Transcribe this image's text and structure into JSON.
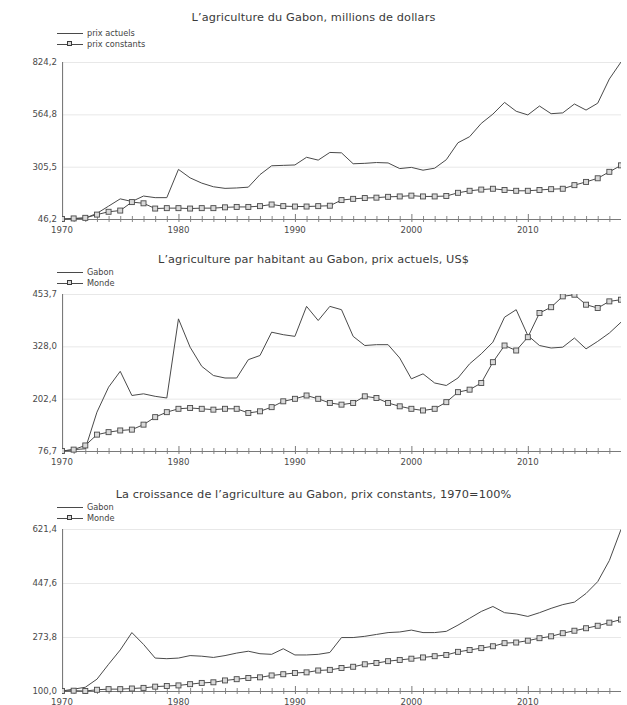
{
  "page": {
    "background": "#ffffff",
    "line_color": "#4a4a4a",
    "grid_color": "#e8e8e8",
    "axis_color": "#7a7a7a",
    "marker_fill": "#d9d9d9",
    "text_color": "#3b3b3b"
  },
  "charts": [
    {
      "id": "agriculture-gabon-millions-dollars",
      "type": "line",
      "title": "L’agriculture du Gabon, millions de dollars",
      "xlabel": "",
      "ylabel": "",
      "grid": true,
      "legend_position": "top-left",
      "x": [
        1970,
        1971,
        1972,
        1973,
        1974,
        1975,
        1976,
        1977,
        1978,
        1979,
        1980,
        1981,
        1982,
        1983,
        1984,
        1985,
        1986,
        1987,
        1988,
        1989,
        1990,
        1991,
        1992,
        1993,
        1994,
        1995,
        1996,
        1997,
        1998,
        1999,
        2000,
        2001,
        2002,
        2003,
        2004,
        2005,
        2006,
        2007,
        2008,
        2009,
        2010,
        2011,
        2012,
        2013,
        2014,
        2015,
        2016,
        2017,
        2018
      ],
      "xticks": [
        1970,
        1980,
        1990,
        2000,
        2010
      ],
      "yticks": [
        46.2,
        305.5,
        564.8,
        824.2
      ],
      "ylim": [
        46.2,
        824.2
      ],
      "xlim": [
        1970,
        2018
      ],
      "series": [
        {
          "name": "prix actuels",
          "marker": "none",
          "values": [
            46.2,
            48.0,
            50.5,
            74.0,
            110.0,
            146.0,
            133.0,
            160.0,
            152.0,
            152.0,
            292.0,
            250.0,
            224.0,
            206.0,
            198.0,
            200.0,
            204.0,
            266.0,
            310.0,
            312.0,
            314.0,
            352.0,
            338.0,
            376.0,
            374.0,
            320.0,
            322.0,
            326.0,
            324.0,
            296.0,
            302.0,
            288.0,
            298.0,
            340.0,
            424.0,
            454.0,
            520.0,
            566.0,
            624.0,
            580.0,
            562.0,
            606.0,
            568.0,
            572.0,
            616.0,
            586.0,
            620.0,
            740.0,
            824.2
          ]
        },
        {
          "name": "prix constants",
          "marker": "square",
          "values": [
            46.2,
            49.0,
            52.0,
            68.0,
            82.0,
            88.0,
            130.0,
            124.0,
            98.0,
            100.0,
            100.0,
            98.0,
            100.0,
            100.0,
            104.0,
            106.0,
            106.0,
            110.0,
            118.0,
            110.0,
            108.0,
            108.0,
            110.0,
            112.0,
            140.0,
            146.0,
            150.0,
            152.0,
            156.0,
            158.0,
            162.0,
            158.0,
            158.0,
            160.0,
            176.0,
            186.0,
            192.0,
            196.0,
            190.0,
            186.0,
            186.0,
            190.0,
            194.0,
            196.0,
            214.0,
            230.0,
            248.0,
            280.0,
            312.0
          ]
        }
      ]
    },
    {
      "id": "agriculture-par-habitant-gabon",
      "type": "line",
      "title": "L’agriculture par habitant au Gabon, prix actuels, US$",
      "xlabel": "",
      "ylabel": "",
      "grid": true,
      "legend_position": "top-left",
      "x": [
        1970,
        1971,
        1972,
        1973,
        1974,
        1975,
        1976,
        1977,
        1978,
        1979,
        1980,
        1981,
        1982,
        1983,
        1984,
        1985,
        1986,
        1987,
        1988,
        1989,
        1990,
        1991,
        1992,
        1993,
        1994,
        1995,
        1996,
        1997,
        1998,
        1999,
        2000,
        2001,
        2002,
        2003,
        2004,
        2005,
        2006,
        2007,
        2008,
        2009,
        2010,
        2011,
        2012,
        2013,
        2014,
        2015,
        2016,
        2017,
        2018
      ],
      "xticks": [
        1970,
        1980,
        1990,
        2000,
        2010
      ],
      "yticks": [
        76.7,
        202.4,
        328.0,
        453.7
      ],
      "ylim": [
        76.7,
        453.7
      ],
      "xlim": [
        1970,
        2018
      ],
      "series": [
        {
          "name": "Gabon",
          "marker": "none",
          "values": [
            76.7,
            80.0,
            82.0,
            170.0,
            230.0,
            268.0,
            210.0,
            214.0,
            208.0,
            204.0,
            394.0,
            326.0,
            280.0,
            258.0,
            252.0,
            252.0,
            296.0,
            306.0,
            362.0,
            356.0,
            352.0,
            424.0,
            390.0,
            424.0,
            416.0,
            352.0,
            330.0,
            332.0,
            332.0,
            300.0,
            250.0,
            262.0,
            240.0,
            234.0,
            252.0,
            286.0,
            310.0,
            338.0,
            398.0,
            416.0,
            354.0,
            330.0,
            324.0,
            326.0,
            348.0,
            322.0,
            340.0,
            360.0,
            386.0
          ]
        },
        {
          "name": "Monde",
          "marker": "square",
          "values": [
            76.7,
            80.0,
            90.0,
            116.0,
            122.0,
            126.0,
            128.0,
            140.0,
            158.0,
            170.0,
            178.0,
            180.0,
            178.0,
            176.0,
            178.0,
            178.0,
            168.0,
            172.0,
            182.0,
            196.0,
            202.0,
            210.0,
            202.0,
            192.0,
            188.0,
            192.0,
            208.0,
            204.0,
            192.0,
            184.0,
            178.0,
            174.0,
            178.0,
            194.0,
            218.0,
            224.0,
            240.0,
            290.0,
            330.0,
            318.0,
            350.0,
            408.0,
            422.0,
            448.0,
            452.0,
            428.0,
            420.0,
            436.0,
            440.0
          ]
        }
      ]
    },
    {
      "id": "croissance-agriculture-gabon",
      "type": "line",
      "title": "La croissance de l’agriculture au Gabon, prix constants, 1970=100%",
      "xlabel": "",
      "ylabel": "",
      "grid": true,
      "legend_position": "top-left",
      "x": [
        1970,
        1971,
        1972,
        1973,
        1974,
        1975,
        1976,
        1977,
        1978,
        1979,
        1980,
        1981,
        1982,
        1983,
        1984,
        1985,
        1986,
        1987,
        1988,
        1989,
        1990,
        1991,
        1992,
        1993,
        1994,
        1995,
        1996,
        1997,
        1998,
        1999,
        2000,
        2001,
        2002,
        2003,
        2004,
        2005,
        2006,
        2007,
        2008,
        2009,
        2010,
        2011,
        2012,
        2013,
        2014,
        2015,
        2016,
        2017,
        2018
      ],
      "xticks": [
        1970,
        1980,
        1990,
        2000,
        2010
      ],
      "yticks": [
        100.0,
        273.8,
        447.6,
        621.4
      ],
      "ylim": [
        100.0,
        621.4
      ],
      "xlim": [
        1970,
        2018
      ],
      "series": [
        {
          "name": "Gabon",
          "marker": "none",
          "values": [
            100.0,
            106.0,
            112.0,
            138.0,
            186.0,
            232.0,
            288.0,
            250.0,
            206.0,
            204.0,
            206.0,
            214.0,
            212.0,
            208.0,
            214.0,
            222.0,
            228.0,
            220.0,
            218.0,
            236.0,
            216.0,
            216.0,
            218.0,
            224.0,
            272.0,
            272.0,
            276.0,
            282.0,
            288.0,
            290.0,
            296.0,
            288.0,
            288.0,
            292.0,
            312.0,
            334.0,
            356.0,
            372.0,
            352.0,
            348.0,
            340.0,
            352.0,
            366.0,
            378.0,
            386.0,
            414.0,
            452.0,
            520.0,
            620.0
          ]
        },
        {
          "name": "Monde",
          "marker": "square",
          "values": [
            100.0,
            101.0,
            100.0,
            104.0,
            106.0,
            106.0,
            108.0,
            110.0,
            114.0,
            116.0,
            118.0,
            122.0,
            126.0,
            128.0,
            134.0,
            138.0,
            142.0,
            144.0,
            150.0,
            154.0,
            158.0,
            160.0,
            166.0,
            168.0,
            174.0,
            178.0,
            186.0,
            190.0,
            196.0,
            200.0,
            204.0,
            208.0,
            212.0,
            216.0,
            226.0,
            232.0,
            238.0,
            244.0,
            254.0,
            256.0,
            262.0,
            270.0,
            276.0,
            286.0,
            294.0,
            302.0,
            310.0,
            320.0,
            330.0
          ]
        }
      ]
    }
  ]
}
